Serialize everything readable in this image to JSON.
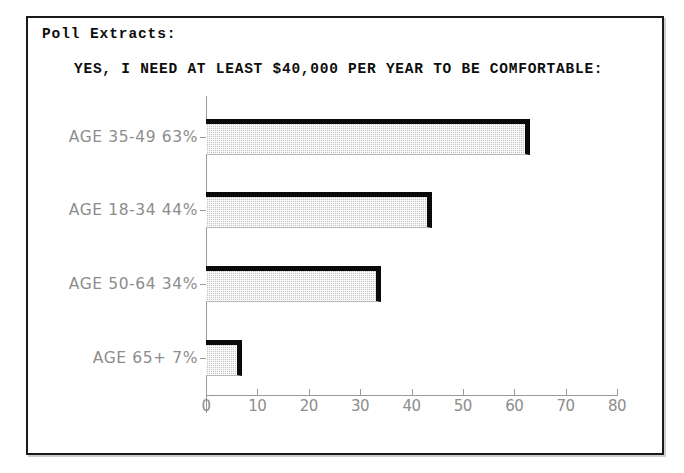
{
  "document": {
    "extract_label": "Poll Extracts:"
  },
  "chart_data": {
    "type": "bar",
    "orientation": "horizontal",
    "title": "YES, I NEED AT LEAST $40,000 PER YEAR TO BE COMFORTABLE:",
    "xlabel": "",
    "ylabel": "",
    "categories": [
      "AGE 35-49",
      "AGE 18-34",
      "AGE 50-64",
      "AGE 65+"
    ],
    "values": [
      63,
      44,
      34,
      7
    ],
    "value_labels": [
      "63%",
      "44%",
      "34%",
      "7%"
    ],
    "axis_labels": [
      "AGE 35-49 63%",
      "AGE 18-34 44%",
      "AGE 50-64 34%",
      "AGE 65+ 7%"
    ],
    "xlim": [
      0,
      80
    ],
    "xticks": [
      0,
      10,
      20,
      30,
      40,
      50,
      60,
      70,
      80
    ],
    "xtick_labels": [
      "0",
      "10",
      "20",
      "30",
      "40",
      "50",
      "60",
      "70",
      "80"
    ],
    "grid": false,
    "legend": null,
    "colors": {
      "bar_fill": "#c4c4c4",
      "bar_edge": "#0a0a0a",
      "axis": "#9a9a9a",
      "tick_text": "#8d8d8d",
      "title_text": "#0d0d0d",
      "frame": "#1a1a1a",
      "background": "#ffffff"
    }
  }
}
